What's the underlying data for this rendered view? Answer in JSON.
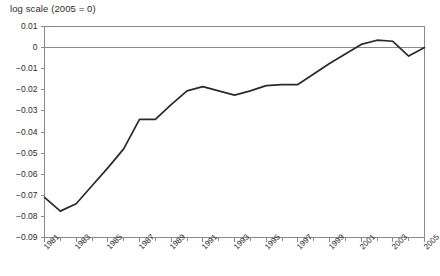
{
  "chart_data": {
    "type": "line",
    "title": "log scale (2005 = 0)",
    "xlabel": "",
    "ylabel": "",
    "xlim": [
      1981,
      2005
    ],
    "ylim": [
      -0.09,
      0.01
    ],
    "grid": false,
    "legend": null,
    "zero_reference_line": 0,
    "y_ticks": [
      0.01,
      0,
      -0.01,
      -0.02,
      -0.03,
      -0.04,
      -0.05,
      -0.06,
      -0.07,
      -0.08,
      -0.09
    ],
    "y_tick_labels": [
      "0.01",
      "0",
      "−0.01",
      "−0.02",
      "−0.03",
      "−0.04",
      "−0.05",
      "−0.06",
      "−0.07",
      "−0.08",
      "−0.09"
    ],
    "x_ticks": [
      1981,
      1983,
      1985,
      1987,
      1989,
      1991,
      1993,
      1995,
      1997,
      1999,
      2001,
      2003,
      2005
    ],
    "x_tick_labels": [
      "1981",
      "1983",
      "1985",
      "1987",
      "1989",
      "1991",
      "1993",
      "1995",
      "1997",
      "1999",
      "2001",
      "2003",
      "2005"
    ],
    "x_minor_ticks": [
      1982,
      1984,
      1986,
      1988,
      1990,
      1992,
      1994,
      1996,
      1998,
      2000,
      2002,
      2004
    ],
    "series": [
      {
        "name": "index",
        "color": "#2a2a2a",
        "x": [
          1981,
          1982,
          1983,
          1984,
          1985,
          1986,
          1987,
          1988,
          1989,
          1990,
          1991,
          1992,
          1993,
          1994,
          1995,
          1996,
          1997,
          1998,
          1999,
          2000,
          2001,
          2002,
          2003,
          2004,
          2005
        ],
        "values": [
          -0.071,
          -0.0775,
          -0.074,
          -0.0655,
          -0.057,
          -0.048,
          -0.034,
          -0.034,
          -0.027,
          -0.0205,
          -0.0185,
          -0.0205,
          -0.0225,
          -0.0205,
          -0.018,
          -0.0175,
          -0.0175,
          -0.0125,
          -0.0075,
          -0.003,
          0.0015,
          0.0035,
          0.003,
          -0.004,
          0.0
        ]
      }
    ],
    "axis_color": "#8a8a8a",
    "line_color": "#2a2a2a",
    "background": "#ffffff"
  },
  "caption": {
    "cut_off_text": ""
  }
}
